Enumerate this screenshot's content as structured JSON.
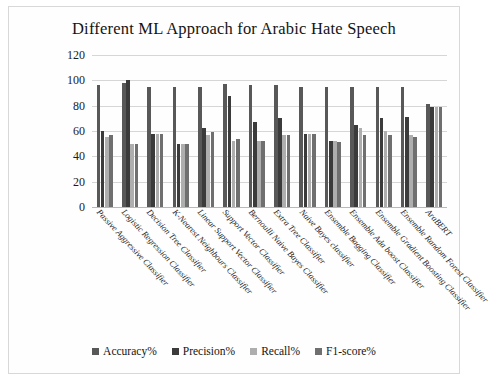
{
  "chart_data": {
    "type": "bar",
    "title": "Different ML Approach for Arabic Hate Speech",
    "xlabel": "",
    "ylabel": "",
    "ylim": [
      0,
      120
    ],
    "yticks": [
      0,
      20,
      40,
      60,
      80,
      100,
      120
    ],
    "grid": true,
    "legend_position": "bottom",
    "categories": [
      "Passive Aggressive Classifier",
      "Logistic Regression  Classifier",
      "Decision Tree Classifier",
      "K-Nearest Neighbours Classifier",
      "Linear Support Vector Classifier",
      "Support Vector Classifier",
      "Bernoulli Naive Bayes Classifier",
      "Extra Tree Classifier",
      "Naive Bayes classifier",
      "Ensemble Bagging Classifier",
      "Ensemble Ada boost Classifier",
      "Ensemble Gradient Boosting Classifier",
      "Ensemble Random Forest Classifier",
      "AraBERT"
    ],
    "series": [
      {
        "name": "Accuracy%",
        "color": "#585858",
        "values": [
          96,
          98,
          95,
          95,
          95,
          97,
          96,
          96,
          95,
          95,
          95,
          95,
          95,
          81
        ]
      },
      {
        "name": "Precision%",
        "color": "#3b3b3b",
        "values": [
          60,
          100,
          58,
          50,
          62,
          88,
          67,
          70,
          58,
          52,
          65,
          70,
          71,
          79
        ]
      },
      {
        "name": "Recall%",
        "color": "#aeaeae",
        "values": [
          55,
          50,
          58,
          50,
          57,
          52,
          52,
          57,
          58,
          52,
          62,
          60,
          57,
          79
        ]
      },
      {
        "name": "F1-score%",
        "color": "#6f6f6f",
        "values": [
          57,
          50,
          58,
          50,
          59,
          54,
          52,
          57,
          58,
          51,
          57,
          57,
          55,
          79
        ]
      }
    ]
  },
  "legend": {
    "items": [
      {
        "label": "Accuracy%",
        "color": "#585858"
      },
      {
        "label": "Precision%",
        "color": "#3b3b3b"
      },
      {
        "label": "Recall%",
        "color": "#aeaeae"
      },
      {
        "label": "F1-score%",
        "color": "#6f6f6f"
      }
    ]
  }
}
